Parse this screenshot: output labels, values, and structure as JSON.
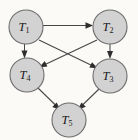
{
  "diagram": {
    "type": "directed-graph",
    "title": "",
    "background_color": "#fbfaf7",
    "node_fill_color": "#d2d2d2",
    "node_stroke_color": "#6d6d6d",
    "edge_color": "#464646",
    "label_color": "#1a1a1a",
    "node_radius": 17,
    "nodes": [
      {
        "id": "T1",
        "base": "T",
        "subscript": "1",
        "label": "T1",
        "cx": 26,
        "cy": 27
      },
      {
        "id": "T2",
        "base": "T",
        "subscript": "2",
        "label": "T2",
        "cx": 110,
        "cy": 27
      },
      {
        "id": "T4",
        "base": "T",
        "subscript": "4",
        "label": "T4",
        "cx": 27,
        "cy": 75
      },
      {
        "id": "T3",
        "base": "T",
        "subscript": "3",
        "label": "T3",
        "cx": 110,
        "cy": 76
      },
      {
        "id": "T5",
        "base": "T",
        "subscript": "5",
        "label": "T5",
        "cx": 69,
        "cy": 120
      }
    ],
    "edges": [
      {
        "id": "T1-T2",
        "from": "T1",
        "to": "T2",
        "directed": true
      },
      {
        "id": "T1-T4",
        "from": "T1",
        "to": "T4",
        "directed": true
      },
      {
        "id": "T1-T3",
        "from": "T1",
        "to": "T3",
        "directed": true
      },
      {
        "id": "T2-T3",
        "from": "T2",
        "to": "T3",
        "directed": true
      },
      {
        "id": "T2-T4",
        "from": "T2",
        "to": "T4",
        "directed": true
      },
      {
        "id": "T4-T5",
        "from": "T4",
        "to": "T5",
        "directed": true
      },
      {
        "id": "T3-T5",
        "from": "T3",
        "to": "T5",
        "directed": true
      }
    ]
  }
}
